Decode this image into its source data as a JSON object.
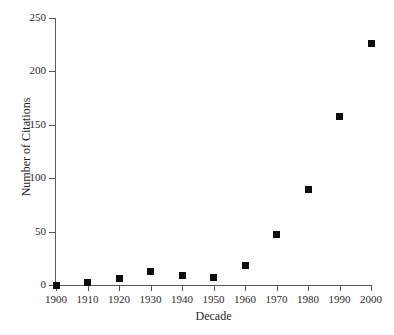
{
  "chart_data": {
    "type": "scatter",
    "title": "",
    "xlabel": "Decade",
    "ylabel": "Number of Citations",
    "x": [
      1900,
      1910,
      1920,
      1930,
      1940,
      1950,
      1960,
      1970,
      1980,
      1990,
      2000
    ],
    "values": [
      0,
      2,
      6,
      13,
      9,
      7,
      18,
      47,
      89,
      158,
      226
    ],
    "categories": [
      "1900",
      "1910",
      "1920",
      "1930",
      "1940",
      "1950",
      "1960",
      "1970",
      "1980",
      "1990",
      "2000"
    ],
    "xlim": [
      1900,
      2000
    ],
    "ylim": [
      0,
      250
    ],
    "x_tick_labels": [
      "1900",
      "1910",
      "1920",
      "1930",
      "1940",
      "1950",
      "1960",
      "1970",
      "1980",
      "1990",
      "2000"
    ],
    "y_tick_labels": [
      "0",
      "50",
      "100",
      "150",
      "200",
      "250"
    ],
    "y_ticks": [
      0,
      50,
      100,
      150,
      200,
      250
    ],
    "grid": false,
    "legend": null,
    "marker": "square",
    "marker_color": "#0d0d0d",
    "axis_color": "#595959",
    "background_color": "#ffffff"
  }
}
